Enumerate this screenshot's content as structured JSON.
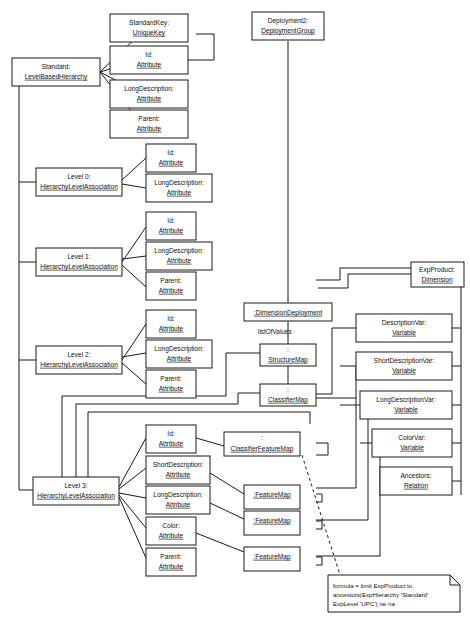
{
  "diagram": {
    "type": "uml-object-diagram",
    "width": 470,
    "height": 622,
    "stroke_color": "#1a1a1a",
    "fill_color": "#ffffff",
    "text_color": "#111111"
  },
  "nodes": {
    "standard": {
      "line1": "Standard:",
      "line2": "LevelBasedHierarchy"
    },
    "standard_key": {
      "line1": "StandardKey:",
      "line2": "UniqueKey"
    },
    "std_id": {
      "line1": "Id:",
      "line2": "Attribute"
    },
    "std_longdesc": {
      "line1": "LongDescription:",
      "line2": "Attribute"
    },
    "std_parent": {
      "line1": "Parent:",
      "line2": "Attribute"
    },
    "deployment2": {
      "line1": "Deployment2:",
      "line2": "DeploymentGroup"
    },
    "level0": {
      "line1": "Level 0:",
      "line2": "HierarchyLevelAssociation"
    },
    "l0_id": {
      "line1": "Id:",
      "line2": "Attribute"
    },
    "l0_longdesc": {
      "line1": "LongDescription:",
      "line2": "Attribute"
    },
    "level1": {
      "line1": "Level 1:",
      "line2": "HierarchyLevelAssociation"
    },
    "l1_id": {
      "line1": "Id:",
      "line2": "Attribute"
    },
    "l1_longdesc": {
      "line1": "LongDescription:",
      "line2": "Attribute"
    },
    "l1_parent": {
      "line1": "Parent:",
      "line2": "Attribute"
    },
    "level2": {
      "line1": "Level 2:",
      "line2": "HierarchyLevelAssociation"
    },
    "l2_id": {
      "line1": "Id:",
      "line2": "Attribute"
    },
    "l2_longdesc": {
      "line1": "LongDescription:",
      "line2": "Attribute"
    },
    "l2_parent": {
      "line1": "Parent:",
      "line2": "Attribute"
    },
    "level3": {
      "line1": "Level 3:",
      "line2": "HierarchyLevelAssociation"
    },
    "l3_id": {
      "line1": "Id:",
      "line2": "Attribute"
    },
    "l3_shortdesc": {
      "line1": "ShortDescription:",
      "line2": "Attribute"
    },
    "l3_longdesc": {
      "line1": "LongDescription:",
      "line2": "Attribute"
    },
    "l3_color": {
      "line1": "Color:",
      "line2": "Attribute"
    },
    "l3_parent": {
      "line1": "Parent:",
      "line2": "Attribute"
    },
    "dimension_deployment": {
      "line1": ":DimensionDeployment"
    },
    "structure_map": {
      "line1": ":",
      "line2": "StructureMap"
    },
    "classifier_map": {
      "line1": ":",
      "line2": "ClassifierMap"
    },
    "classifier_feature_map": {
      "line1": ":",
      "line2": "ClassifierFeatureMap"
    },
    "feature_map_1": {
      "line1": ":FeatureMap"
    },
    "feature_map_2": {
      "line1": ":FeatureMap"
    },
    "feature_map_3": {
      "line1": ":FeatureMap"
    },
    "exp_product": {
      "line1": "ExpProduct:",
      "line2": "Dimension"
    },
    "description_var": {
      "line1": "DescriptionVar:",
      "line2": "Variable"
    },
    "short_description_var": {
      "line1": "ShortDescriptionVar:",
      "line2": "Variable"
    },
    "long_description_var": {
      "line1": "LongDescriptionVar:",
      "line2": "Variable"
    },
    "color_var": {
      "line1": "ColorVar:",
      "line2": "Variable"
    },
    "ancestors": {
      "line1": "Ancestors:",
      "line2": "Relation"
    }
  },
  "edge_labels": {
    "list_of_values": "listOfValues"
  },
  "note": {
    "line1": "formula = limit ExpProduct to",
    "line2": "ancestors(ExpHierarchy 'Standard'",
    "line3": "ExpLevel 'UPC') ne na"
  }
}
